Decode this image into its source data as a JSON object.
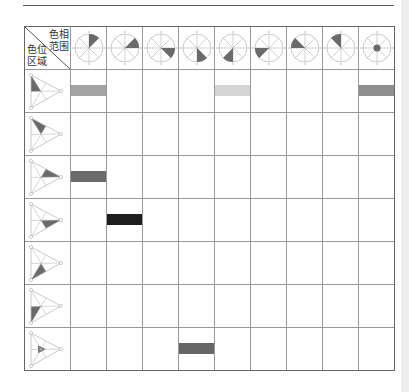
{
  "header": {
    "corner_top_label": [
      "色相",
      "范围"
    ],
    "corner_bottom_label": [
      "色位",
      "区域"
    ]
  },
  "columns": [
    {
      "id": "hue-n-ne",
      "sector_start_deg": 0,
      "sector_end_deg": 45,
      "type": "sector"
    },
    {
      "id": "hue-ne-e",
      "sector_start_deg": 45,
      "sector_end_deg": 90,
      "type": "sector"
    },
    {
      "id": "hue-e-se",
      "sector_start_deg": 90,
      "sector_end_deg": 135,
      "type": "sector"
    },
    {
      "id": "hue-se-s",
      "sector_start_deg": 135,
      "sector_end_deg": 180,
      "type": "sector"
    },
    {
      "id": "hue-s-sw",
      "sector_start_deg": 180,
      "sector_end_deg": 225,
      "type": "sector"
    },
    {
      "id": "hue-sw-w",
      "sector_start_deg": 225,
      "sector_end_deg": 270,
      "type": "sector"
    },
    {
      "id": "hue-w-nw",
      "sector_start_deg": 270,
      "sector_end_deg": 315,
      "type": "sector"
    },
    {
      "id": "hue-nw-n",
      "sector_start_deg": 315,
      "sector_end_deg": 360,
      "type": "sector"
    },
    {
      "id": "hue-center",
      "type": "center-dot"
    }
  ],
  "rows": [
    {
      "region": "left-upper"
    },
    {
      "region": "top-left"
    },
    {
      "region": "top-right"
    },
    {
      "region": "bottom-right"
    },
    {
      "region": "bottom-left"
    },
    {
      "region": "left-lower"
    },
    {
      "region": "center"
    }
  ],
  "bars": [
    {
      "row": 0,
      "col": 0,
      "color": "#a3a3a3"
    },
    {
      "row": 0,
      "col": 4,
      "color": "#d4d4d4"
    },
    {
      "row": 0,
      "col": 8,
      "color": "#8f8f8f"
    },
    {
      "row": 2,
      "col": 0,
      "color": "#6b6b6b"
    },
    {
      "row": 3,
      "col": 1,
      "color": "#1e1e1e"
    },
    {
      "row": 6,
      "col": 3,
      "color": "#666666"
    }
  ],
  "colors": {
    "fill": "#6a6a6a",
    "wheel_line": "#bbbbbb",
    "grid_line": "#999999"
  }
}
